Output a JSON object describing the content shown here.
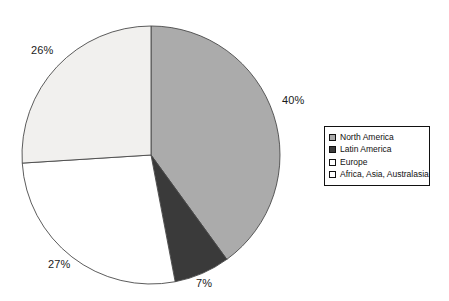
{
  "chart_data": {
    "type": "pie",
    "title": "",
    "subtitle": "",
    "xlabel": "",
    "ylabel": "",
    "grid": false,
    "legend_position": "right",
    "start_angle_deg": 0,
    "direction": "clockwise",
    "categories": [
      "North America",
      "Latin America",
      "Europe",
      "Africa, Asia, Australasia"
    ],
    "values": [
      40,
      7,
      27,
      26
    ],
    "value_unit": "%",
    "data_labels": [
      "40%",
      "7%",
      "27%",
      "26%"
    ],
    "slice_colors": [
      "#ababab",
      "#3a3a3a",
      "#ffffff",
      "#f1f0ee"
    ],
    "slice_border_color": "#4a4a4a",
    "slices": [
      {
        "label": "North America",
        "value": 40,
        "display": "40%",
        "color": "#ababab",
        "start_deg": 0,
        "end_deg": 144
      },
      {
        "label": "Latin America",
        "value": 7,
        "display": "7%",
        "color": "#3a3a3a",
        "start_deg": 144,
        "end_deg": 169.2
      },
      {
        "label": "Europe",
        "value": 27,
        "display": "27%",
        "color": "#ffffff",
        "start_deg": 169.2,
        "end_deg": 266.4
      },
      {
        "label": "Africa, Asia, Australasia",
        "value": 26,
        "display": "26%",
        "color": "#f1f0ee",
        "start_deg": 266.4,
        "end_deg": 360
      }
    ]
  },
  "labels": {
    "north_america": "40%",
    "latin_america": "7%",
    "europe": "27%",
    "africa_asia": "26%"
  },
  "legend": {
    "items": [
      {
        "label": "North America",
        "swatch_color": "#ababab"
      },
      {
        "label": "Latin America",
        "swatch_color": "#3a3a3a"
      },
      {
        "label": "Europe",
        "swatch_color": "#ffffff"
      },
      {
        "label": "Africa, Asia, Australasia",
        "swatch_color": "#ffffff"
      }
    ]
  },
  "geometry": {
    "center_x": 151,
    "center_y": 155,
    "radius": 129
  }
}
